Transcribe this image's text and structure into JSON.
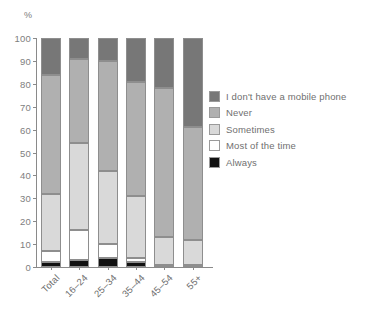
{
  "chart_data": {
    "type": "bar",
    "subtype": "stacked-bar-100",
    "title": "",
    "subtitle": "",
    "xlabel": "",
    "ylabel": "%",
    "ylim": [
      0,
      100
    ],
    "y_ticks": [
      0,
      10,
      20,
      30,
      40,
      50,
      60,
      70,
      80,
      90,
      100
    ],
    "y_tick_labels": [
      "0",
      "10",
      "20",
      "30",
      "40",
      "50",
      "60",
      "70",
      "80",
      "90",
      "100"
    ],
    "grid": false,
    "legend_position": "right",
    "categories": [
      "Total",
      "16–24",
      "25–34",
      "35–44",
      "45–54",
      "55+"
    ],
    "series": [
      {
        "name": "Always",
        "color": "#111111",
        "values": [
          2,
          3,
          4,
          2,
          1,
          1
        ]
      },
      {
        "name": "Most of the time",
        "color": "#ffffff",
        "values": [
          5,
          13,
          6,
          2,
          0,
          0
        ]
      },
      {
        "name": "Sometimes",
        "color": "#d9d9d9",
        "values": [
          25,
          38,
          32,
          27,
          12,
          11
        ]
      },
      {
        "name": "Never",
        "color": "#b0b0b0",
        "values": [
          52,
          37,
          48,
          50,
          65,
          49
        ]
      },
      {
        "name": "I don't have a mobile phone",
        "color": "#777777",
        "values": [
          16,
          9,
          10,
          19,
          22,
          39
        ]
      }
    ],
    "cumulative_boundaries": {
      "Total": [
        0,
        2,
        7,
        32,
        84,
        100
      ],
      "16–24": [
        0,
        3,
        16,
        54,
        91,
        100
      ],
      "25–34": [
        0,
        4,
        10,
        42,
        90,
        100
      ],
      "35–44": [
        0,
        2,
        4,
        31,
        81,
        100
      ],
      "45–54": [
        0,
        1,
        1,
        13,
        78,
        100
      ],
      "55+": [
        0,
        1,
        1,
        12,
        61,
        100
      ]
    }
  },
  "legend": {
    "entries": [
      {
        "label": "I don't have a mobile phone",
        "color": "#777777"
      },
      {
        "label": "Never",
        "color": "#b0b0b0"
      },
      {
        "label": "Sometimes",
        "color": "#d9d9d9"
      },
      {
        "label": "Most of the time",
        "color": "#ffffff"
      },
      {
        "label": "Always",
        "color": "#111111"
      }
    ]
  },
  "axis": {
    "y_unit_label": "%"
  },
  "colors": {
    "axis_line": "#8a8a8a",
    "tick_text": "#7e7e7e",
    "label_text": "#6f6f6f",
    "background": "#ffffff",
    "segment_border": "#8e8e8e"
  }
}
